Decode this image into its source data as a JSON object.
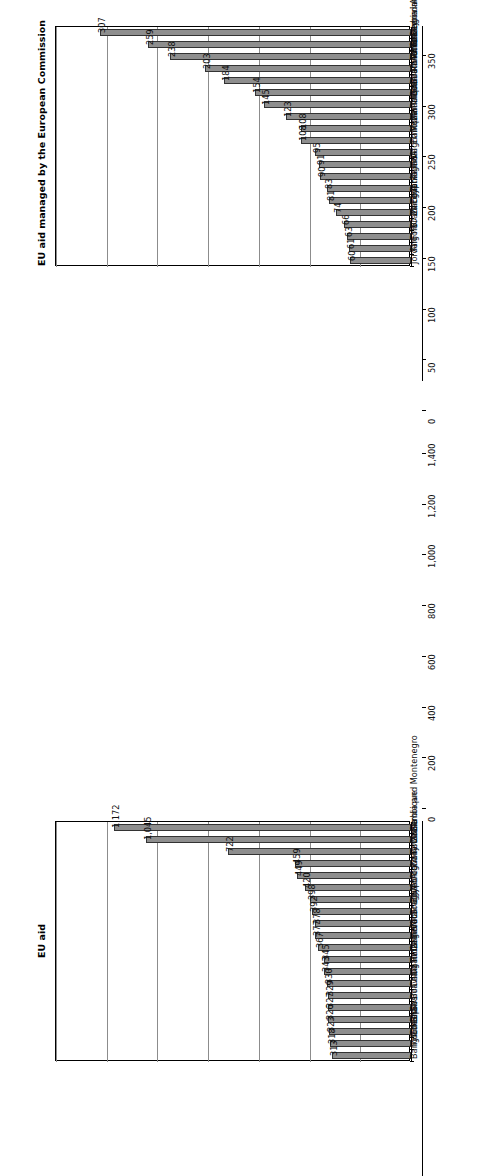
{
  "figure": {
    "background": "#ffffff",
    "bar_fill": "#8e8e8e",
    "bar_stroke": "#333333",
    "gridline_color": "#8c8c8c",
    "axis_color": "#000000",
    "orientation_note": "rotated-90-ccw"
  },
  "chart_data": [
    {
      "id": "top",
      "type": "bar",
      "title": "EU aid managed by the European Commission",
      "xlabel": "",
      "ylabel": "",
      "ylim": [
        0,
        350
      ],
      "yticks": [
        0,
        50,
        100,
        150,
        200,
        250,
        300,
        350
      ],
      "ytick_labels": [
        "0",
        "50",
        "100",
        "150",
        "200",
        "250",
        "300",
        "350"
      ],
      "grid": true,
      "legend": null,
      "categories": [
        "Serbia and Montenegro",
        "Turkey",
        "Tunisia",
        "Morocco",
        "South Africa",
        "Bosnia and Herzegovina",
        "Palestinian Administered Areas",
        "Mauritania",
        "Mozambique",
        "Ethiopia",
        "Afghanistan",
        "India",
        "Algeria",
        "Tanzania",
        "Egypt",
        "Zambia",
        "Brazil",
        "FYRO Macedonia",
        "Angola",
        "Jordan"
      ],
      "values": [
        307,
        259,
        238,
        203,
        184,
        154,
        145,
        123,
        108,
        108,
        95,
        91,
        90,
        83,
        81,
        74,
        66,
        63,
        61,
        60
      ],
      "value_labels": [
        "307",
        "259",
        "238",
        "203",
        "184",
        "154",
        "145",
        "123",
        "108",
        "108",
        "95",
        "91",
        "90",
        "83",
        "81",
        "74",
        "66",
        "63",
        "61",
        "60"
      ]
    },
    {
      "id": "bottom",
      "type": "bar",
      "title": "EU aid",
      "xlabel": "",
      "ylabel": "",
      "ylim": [
        0,
        1400
      ],
      "yticks": [
        0,
        200,
        400,
        600,
        800,
        1000,
        1200,
        1400
      ],
      "ytick_labels": [
        "0",
        "200",
        "400",
        "600",
        "800",
        "1,000",
        "1,200",
        "1,400"
      ],
      "grid": true,
      "legend": null,
      "categories": [
        "Serbia and Montenegro",
        "Mozambique",
        "Tanzania",
        "Ivory Coast",
        "Afghanistan",
        "Morocco",
        "Egypt",
        "South Africa",
        "Nicaragua",
        "India",
        "Cameroon",
        "Tunisia",
        "Uganda",
        "China",
        "Bolivia",
        "Bosnia and Herzegovina",
        "Ghana",
        "Ethiopia",
        "Indonesia",
        "Bangladesh"
      ],
      "values": [
        1172,
        1045,
        722,
        459,
        449,
        420,
        398,
        392,
        378,
        377,
        367,
        345,
        343,
        330,
        329,
        327,
        326,
        323,
        318,
        313
      ],
      "value_labels": [
        "1,172",
        "1,045",
        "722",
        "459",
        "449",
        "420",
        "398",
        "392",
        "378",
        "377",
        "367",
        "345",
        "343",
        "330",
        "329",
        "327",
        "326",
        "323",
        "318",
        "313"
      ]
    }
  ]
}
